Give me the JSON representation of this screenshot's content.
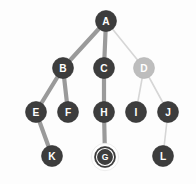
{
  "figure": {
    "background_color": "#fdfdfd",
    "width": 196,
    "height": 184
  },
  "palette": {
    "node_dark": "#3d3d3d",
    "node_dark_stroke": "#2f2f2f",
    "node_faded": "#bdbdbd",
    "node_faded_stroke": "#b3b3b3",
    "label_on_dark": "#ffffff",
    "label_on_faded": "#ffffff",
    "edge_active": "#9a9a9a",
    "edge_faded": "#d6d6d6",
    "highlight_ring": "#ffffff",
    "highlight_inner_ring": "#2b2b2b"
  },
  "chart_data": {
    "type": "diagram",
    "nodes": [
      {
        "id": "A",
        "label": "A",
        "x": 106,
        "y": 21,
        "r": 10.5,
        "depth": 0,
        "state": "visited",
        "fill": "#3d3d3d",
        "text_color": "#ffffff",
        "highlighted": false
      },
      {
        "id": "B",
        "label": "B",
        "x": 63,
        "y": 68,
        "r": 10.5,
        "depth": 1,
        "state": "visited",
        "fill": "#3d3d3d",
        "text_color": "#ffffff",
        "highlighted": false
      },
      {
        "id": "C",
        "label": "C",
        "x": 104,
        "y": 68,
        "r": 10.5,
        "depth": 1,
        "state": "visited",
        "fill": "#3d3d3d",
        "text_color": "#ffffff",
        "highlighted": false
      },
      {
        "id": "D",
        "label": "D",
        "x": 144,
        "y": 68,
        "r": 10.5,
        "depth": 1,
        "state": "faded",
        "fill": "#bdbdbd",
        "text_color": "#ffffff",
        "highlighted": false
      },
      {
        "id": "E",
        "label": "E",
        "x": 36,
        "y": 112,
        "r": 10.5,
        "depth": 2,
        "state": "visited",
        "fill": "#3d3d3d",
        "text_color": "#ffffff",
        "highlighted": false
      },
      {
        "id": "F",
        "label": "F",
        "x": 68,
        "y": 112,
        "r": 10.5,
        "depth": 2,
        "state": "visited",
        "fill": "#3d3d3d",
        "text_color": "#ffffff",
        "highlighted": false
      },
      {
        "id": "H",
        "label": "H",
        "x": 104,
        "y": 112,
        "r": 10.5,
        "depth": 2,
        "state": "visited",
        "fill": "#3d3d3d",
        "text_color": "#ffffff",
        "highlighted": false
      },
      {
        "id": "I",
        "label": "I",
        "x": 136,
        "y": 112,
        "r": 10.5,
        "depth": 2,
        "state": "visited",
        "fill": "#3d3d3d",
        "text_color": "#ffffff",
        "highlighted": false
      },
      {
        "id": "J",
        "label": "J",
        "x": 168,
        "y": 112,
        "r": 10.5,
        "depth": 2,
        "state": "visited",
        "fill": "#3d3d3d",
        "text_color": "#ffffff",
        "highlighted": false
      },
      {
        "id": "K",
        "label": "K",
        "x": 52,
        "y": 156,
        "r": 10.5,
        "depth": 3,
        "state": "visited",
        "fill": "#3d3d3d",
        "text_color": "#ffffff",
        "highlighted": false
      },
      {
        "id": "G",
        "label": "G",
        "x": 105,
        "y": 157,
        "r": 10.5,
        "depth": 3,
        "state": "current",
        "fill": "#3d3d3d",
        "text_color": "#ffffff",
        "highlighted": true
      },
      {
        "id": "L",
        "label": "L",
        "x": 163,
        "y": 156,
        "r": 10.5,
        "depth": 3,
        "state": "visited",
        "fill": "#3d3d3d",
        "text_color": "#ffffff",
        "highlighted": false
      }
    ],
    "edges": [
      {
        "from": "A",
        "to": "B",
        "style": "active",
        "color": "#9a9a9a",
        "width": 4.2
      },
      {
        "from": "A",
        "to": "C",
        "style": "active",
        "color": "#9a9a9a",
        "width": 4.2
      },
      {
        "from": "A",
        "to": "D",
        "style": "faded",
        "color": "#d6d6d6",
        "width": 1.6
      },
      {
        "from": "B",
        "to": "E",
        "style": "active",
        "color": "#9a9a9a",
        "width": 4.2
      },
      {
        "from": "B",
        "to": "F",
        "style": "active",
        "color": "#9a9a9a",
        "width": 4.2
      },
      {
        "from": "C",
        "to": "H",
        "style": "active",
        "color": "#9a9a9a",
        "width": 4.2
      },
      {
        "from": "D",
        "to": "I",
        "style": "faded",
        "color": "#d6d6d6",
        "width": 1.6
      },
      {
        "from": "D",
        "to": "J",
        "style": "faded",
        "color": "#d6d6d6",
        "width": 1.6
      },
      {
        "from": "E",
        "to": "K",
        "style": "active",
        "color": "#9a9a9a",
        "width": 4.2
      },
      {
        "from": "H",
        "to": "G",
        "style": "active",
        "color": "#9a9a9a",
        "width": 4.2
      },
      {
        "from": "J",
        "to": "L",
        "style": "faded",
        "color": "#d6d6d6",
        "width": 1.6
      }
    ],
    "highlighted_node": "G",
    "root": "A",
    "node_count": 12,
    "edge_count": 11,
    "grid": false,
    "legend": null,
    "xlabel": "",
    "ylabel": ""
  }
}
